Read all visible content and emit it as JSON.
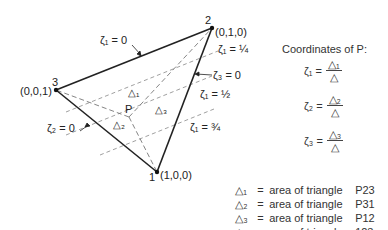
{
  "diagram": {
    "vertices": [
      {
        "id": "1",
        "label": "1",
        "coords": "(1,0,0)"
      },
      {
        "id": "2",
        "label": "2",
        "coords": "(0,1,0)"
      },
      {
        "id": "3",
        "label": "3",
        "coords": "(0,0,1)"
      }
    ],
    "point_label": "P",
    "edge_labels": {
      "zeta1_zero": "ζ₁ = 0",
      "zeta2_zero": "ζ₂ = 0",
      "zeta3_zero": "ζ₃ = 0"
    },
    "isoline_labels": {
      "q1": "ζ₁ = ¼",
      "q2": "ζ₁ = ½",
      "q3": "ζ₁ = ¾"
    },
    "subarea_labels": [
      "△₁",
      "△₂",
      "△₃"
    ]
  },
  "coordinates": {
    "title": "Coordinates of P:",
    "equations": [
      {
        "lhs": "ζ₁ =",
        "num": "△₁",
        "den": "△"
      },
      {
        "lhs": "ζ₂ =",
        "num": "△₂",
        "den": "△"
      },
      {
        "lhs": "ζ₃ =",
        "num": "△₃",
        "den": "△"
      }
    ]
  },
  "legend": [
    {
      "symbol": "△₁",
      "eq": "=",
      "desc": "area of triangle",
      "ref": "P23"
    },
    {
      "symbol": "△₂",
      "eq": "=",
      "desc": "area of triangle",
      "ref": "P31"
    },
    {
      "symbol": "△₃",
      "eq": "=",
      "desc": "area of triangle",
      "ref": "P12"
    },
    {
      "symbol": "△",
      "eq": "=",
      "desc": "area of triangle",
      "ref": "123"
    }
  ]
}
